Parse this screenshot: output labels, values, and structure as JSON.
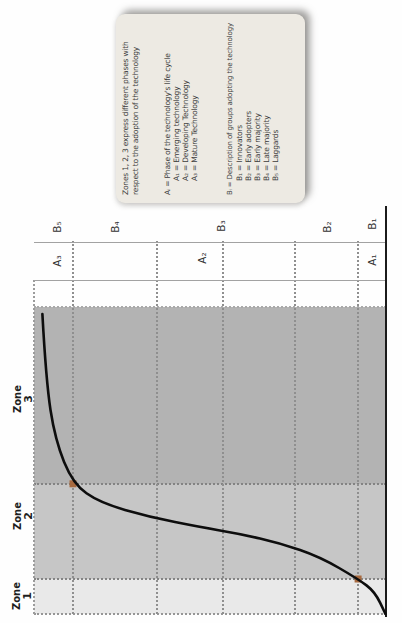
{
  "legend": {
    "intro_line1": "Zones 1, 2, 3 express different phases with",
    "intro_line2": "respect to the adoption of the technology",
    "a_header": "Aᵢ = Phase of the technology's life cycle",
    "a_items": [
      "A₁ = Emerging technology",
      "A₂ = Developing Technology",
      "A₃ = Mature Technology"
    ],
    "b_header": "Bᵢ = Description of groups adopting the technology",
    "b_items": [
      "B₁ = Innovators",
      "B₂ = Early adopters",
      "B₃ = Early majority",
      "B₄ = Late majority",
      "B₅ = Laggards"
    ]
  },
  "band": {
    "b_labels": [
      "B₅",
      "B₄",
      "B₃",
      "B₂",
      "B₁"
    ],
    "a_labels": [
      "A₃",
      "A₂",
      "A₁"
    ]
  },
  "zones": {
    "labels": [
      {
        "word": "Zone",
        "num": "3"
      },
      {
        "word": "Zone",
        "num": "2"
      },
      {
        "word": "Zone",
        "num": "1"
      }
    ]
  },
  "colors": {
    "zone3_fill": "#b3b3b3",
    "zone2_fill": "#c6c6c6",
    "zone1_fill": "#e9e9e9",
    "legend_background": "#edeae3",
    "curve": "#0d0d0d",
    "marker": "#a86a3f"
  },
  "chart_data": {
    "type": "line",
    "title": "",
    "xlabel": "",
    "ylabel": "",
    "orientation": "figure printed rotated 90° CCW; original orientation: S-curve of cumulative technology adoption (y) vs time (x), both axes unlabeled, normalized 0-1",
    "zones_x": [
      {
        "name": "Zone 1",
        "span": [
          0,
          0.12
        ]
      },
      {
        "name": "Zone 2",
        "span": [
          0.12,
          0.43
        ]
      },
      {
        "name": "Zone 3",
        "span": [
          0.43,
          1.0
        ]
      }
    ],
    "b_band_boundaries_y": [
      0.08,
      0.26,
      0.46,
      0.65,
      0.89
    ],
    "a_band_boundaries_y": [
      0.08,
      0.89
    ],
    "series": [
      {
        "name": "adoption S-curve",
        "points": [
          [
            0.977,
            0.976
          ],
          [
            0.762,
            0.966
          ],
          [
            0.567,
            0.94
          ],
          [
            0.424,
            0.889
          ],
          [
            0.362,
            0.812
          ],
          [
            0.316,
            0.67
          ],
          [
            0.283,
            0.528
          ],
          [
            0.261,
            0.414
          ],
          [
            0.231,
            0.3
          ],
          [
            0.186,
            0.186
          ],
          [
            0.114,
            0.078
          ],
          [
            0.072,
            0.03
          ],
          [
            0.0,
            0.0
          ]
        ]
      }
    ],
    "markers": [
      [
        0.424,
        0.889
      ],
      [
        0.114,
        0.078
      ]
    ],
    "grid": "dotted gridlines at band boundaries",
    "legend_position": "bottom-right of original (top-right of rotated scan)"
  }
}
